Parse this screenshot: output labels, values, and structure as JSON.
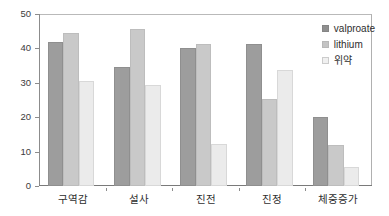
{
  "chart_data": {
    "type": "bar",
    "title": "",
    "subtitle": "",
    "xlabel": "",
    "ylabel": "",
    "ylim": [
      0,
      50
    ],
    "yticks": [
      0,
      10,
      20,
      30,
      40,
      50
    ],
    "ytick_labels": [
      "0",
      "10",
      "20",
      "30",
      "40",
      "50"
    ],
    "grid": false,
    "legend_position": "top-right",
    "categories": [
      "구역감",
      "설사",
      "진전",
      "진정",
      "체중증가"
    ],
    "series": [
      {
        "name": "valproate",
        "color": "#9d9d9d",
        "values": [
          42,
          34.5,
          40.2,
          41.2,
          20
        ]
      },
      {
        "name": "lithium",
        "color": "#c9c9c9",
        "values": [
          44.6,
          45.6,
          41.4,
          25.2,
          12
        ]
      },
      {
        "name": "위약",
        "color": "#ebebeb",
        "values": [
          30.6,
          29.4,
          12.2,
          33.8,
          5.5
        ]
      }
    ]
  },
  "legend": {
    "items": [
      {
        "label": "valproate"
      },
      {
        "label": "lithium"
      },
      {
        "label": "위약"
      }
    ]
  }
}
